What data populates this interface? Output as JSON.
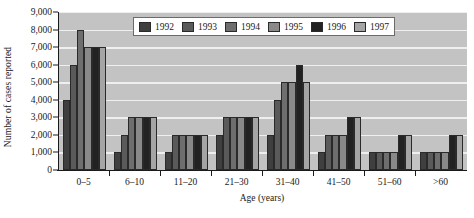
{
  "chart_data": {
    "type": "bar",
    "title": "",
    "xlabel": "Age (years)",
    "ylabel": "Number of cases reported",
    "categories": [
      "0–5",
      "6–10",
      "11–20",
      "21–30",
      "31–40",
      "41–50",
      "51–60",
      ">60"
    ],
    "series": [
      {
        "name": "1992",
        "color": "#3f3f3f",
        "values": [
          4000,
          1000,
          1000,
          2000,
          2000,
          1000,
          1000,
          1000
        ]
      },
      {
        "name": "1993",
        "color": "#5a5a5a",
        "values": [
          6000,
          2000,
          2000,
          3000,
          4000,
          2000,
          1000,
          1000
        ]
      },
      {
        "name": "1994",
        "color": "#6e6e6e",
        "values": [
          8000,
          3000,
          2000,
          3000,
          5000,
          2000,
          1000,
          1000
        ]
      },
      {
        "name": "1995",
        "color": "#898989",
        "values": [
          7000,
          3000,
          2000,
          3000,
          5000,
          2000,
          1000,
          1000
        ]
      },
      {
        "name": "1996",
        "color": "#222222",
        "values": [
          7000,
          3000,
          2000,
          3000,
          6000,
          3000,
          2000,
          2000
        ]
      },
      {
        "name": "1997",
        "color": "#a5a5a5",
        "values": [
          7000,
          3000,
          2000,
          3000,
          5000,
          3000,
          2000,
          2000
        ]
      }
    ],
    "ylim": [
      0,
      9000
    ],
    "yticks": [
      0,
      1000,
      2000,
      3000,
      4000,
      5000,
      6000,
      7000,
      8000,
      9000
    ],
    "ytick_labels": [
      "0",
      "1,000",
      "2,000",
      "3,000",
      "4,000",
      "5,000",
      "6,000",
      "7,000",
      "8,000",
      "9,000"
    ],
    "grid": true,
    "legend_position": "top-center",
    "plot_background": "#c3c3c3",
    "gridline_color": "#efefef"
  }
}
